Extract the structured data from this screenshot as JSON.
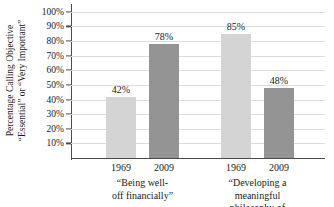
{
  "chart_data": {
    "type": "bar",
    "title": "",
    "xlabel": "",
    "ylabel": "Percentage Calling Objective “Essential” or “Very Important”",
    "ylabel_lines": [
      "Percentage Calling Objective",
      "“Essential” or “Very Important”"
    ],
    "ylim": [
      0,
      100
    ],
    "ytick_labels": [
      "100%",
      "90%",
      "80%",
      "70%",
      "60%",
      "50%",
      "40%",
      "30%",
      "20%",
      "10%"
    ],
    "ytick_values": [
      100,
      90,
      80,
      70,
      60,
      50,
      40,
      30,
      20,
      10
    ],
    "grid": true,
    "legend": "none",
    "categories": [
      "1969",
      "2009"
    ],
    "groups": [
      {
        "label_lines": [
          "“Being well-",
          "off financially”"
        ],
        "label": "“Being well-off financially”",
        "bars": [
          {
            "category": "1969",
            "value": 42,
            "data_label": "42%",
            "color": "#d4d4d4"
          },
          {
            "category": "2009",
            "value": 78,
            "data_label": "78%",
            "color": "#949494"
          }
        ]
      },
      {
        "label_lines": [
          "“Developing a meaningful",
          "philosophy of life”"
        ],
        "label": "“Developing a meaningful philosophy of life”",
        "bars": [
          {
            "category": "1969",
            "value": 85,
            "data_label": "85%",
            "color": "#d4d4d4"
          },
          {
            "category": "2009",
            "value": 48,
            "data_label": "48%",
            "color": "#949494"
          }
        ]
      }
    ],
    "series": [
      {
        "name": "1969",
        "values": [
          42,
          85
        ],
        "color": "#d4d4d4"
      },
      {
        "name": "2009",
        "values": [
          78,
          48
        ],
        "color": "#949494"
      }
    ],
    "colors": {
      "series_1969": "#d4d4d4",
      "series_2009": "#949494",
      "gridline": "#dcdcdc",
      "axis": "#4a4a4a",
      "text": "#1a1a1a",
      "background": "#ffffff"
    }
  }
}
